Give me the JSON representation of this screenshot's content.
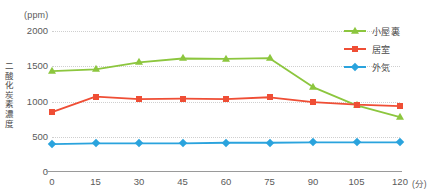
{
  "chart_data": {
    "type": "line",
    "title": "",
    "xlabel": "分",
    "ylabel": "二酸化炭素濃度",
    "yunit": "(ppm)",
    "xunit": "(分)",
    "x": [
      0,
      15,
      30,
      45,
      60,
      75,
      90,
      105,
      120
    ],
    "xticklabels": [
      "0",
      "15",
      "30",
      "45",
      "60",
      "75",
      "90",
      "105",
      "120"
    ],
    "yticklabels": [
      "0",
      "500",
      "1000",
      "1500",
      "2000"
    ],
    "yticks": [
      0,
      500,
      1000,
      1500,
      2000
    ],
    "ylim": [
      0,
      2000
    ],
    "xlim": [
      0,
      120
    ],
    "grid": true,
    "legend_position": "right",
    "series": [
      {
        "name": "小屋裏",
        "color": "#8cc63e",
        "marker": "triangle",
        "values": [
          1430,
          1455,
          1555,
          1610,
          1605,
          1615,
          1205,
          945,
          780
        ]
      },
      {
        "name": "居室",
        "color": "#ef4e35",
        "marker": "square",
        "values": [
          850,
          1070,
          1035,
          1040,
          1035,
          1060,
          990,
          955,
          935
        ]
      },
      {
        "name": "外気",
        "color": "#2aa3dd",
        "marker": "diamond",
        "values": [
          395,
          405,
          405,
          405,
          415,
          415,
          420,
          420,
          420
        ]
      }
    ]
  },
  "axis": {
    "y_unit_caption": "(ppm)",
    "y_title": "二酸化炭素濃度",
    "x_unit_caption": "(分)"
  },
  "legend": {
    "items": [
      {
        "label": "小屋裏"
      },
      {
        "label": "居室"
      },
      {
        "label": "外気"
      }
    ]
  },
  "colors": {
    "series_attic": "#8cc63e",
    "series_room": "#ef4e35",
    "series_outside": "#2aa3dd",
    "grid": "#cfcfcf",
    "axis": "#9a9a9a",
    "text": "#4a4a4a"
  }
}
